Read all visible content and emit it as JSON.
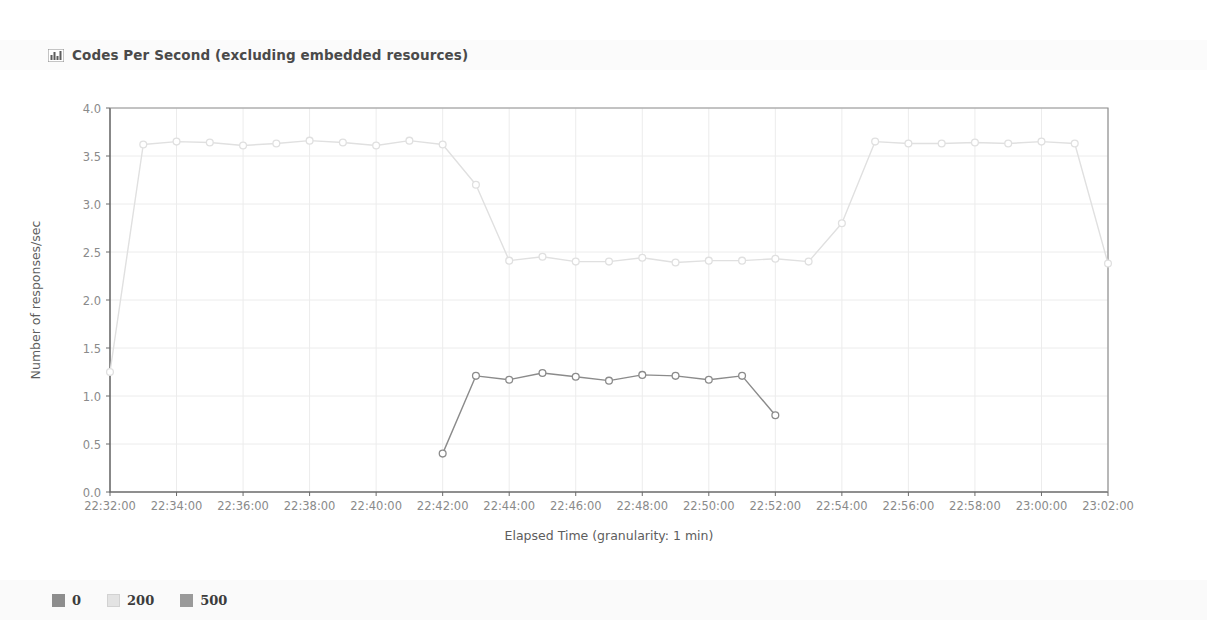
{
  "panel": {
    "icon": "bar-chart-icon",
    "title": "Codes Per Second (excluding embedded resources)"
  },
  "legend": {
    "items": [
      {
        "label": "0",
        "color": "#8d8d8d"
      },
      {
        "label": "200",
        "color": "#e3e3e3"
      },
      {
        "label": "500",
        "color": "#9a9a9a"
      }
    ]
  },
  "chart_data": {
    "type": "line",
    "title": "Codes Per Second (excluding embedded resources)",
    "xlabel": "Elapsed Time (granularity: 1 min)",
    "ylabel": "Number of responses/sec",
    "ylim": [
      0.0,
      4.0
    ],
    "yticks": [
      "0.0",
      "0.5",
      "1.0",
      "1.5",
      "2.0",
      "2.5",
      "3.0",
      "3.5",
      "4.0"
    ],
    "ytick_values": [
      0.0,
      0.5,
      1.0,
      1.5,
      2.0,
      2.5,
      3.0,
      3.5,
      4.0
    ],
    "xticks": [
      "22:32:00",
      "22:34:00",
      "22:36:00",
      "22:38:00",
      "22:40:00",
      "22:42:00",
      "22:44:00",
      "22:46:00",
      "22:48:00",
      "22:50:00",
      "22:52:00",
      "22:54:00",
      "22:56:00",
      "22:58:00",
      "23:00:00",
      "23:02:00"
    ],
    "xtick_minutes": [
      0,
      2,
      4,
      6,
      8,
      10,
      12,
      14,
      16,
      18,
      20,
      22,
      24,
      26,
      28,
      30
    ],
    "xlim_minutes": [
      0,
      30
    ],
    "grid": true,
    "legend_position": "below",
    "markers": "circle",
    "series": [
      {
        "name": "200",
        "color": "#e0e0e0",
        "x_minutes": [
          0,
          1,
          2,
          3,
          4,
          5,
          6,
          7,
          8,
          9,
          10,
          11,
          12,
          13,
          14,
          15,
          16,
          17,
          18,
          19,
          20,
          21,
          22,
          23,
          24,
          25,
          26,
          27,
          28,
          29,
          30
        ],
        "values": [
          1.25,
          3.62,
          3.65,
          3.64,
          3.61,
          3.63,
          3.66,
          3.64,
          3.61,
          3.66,
          3.62,
          3.2,
          2.41,
          2.45,
          2.4,
          2.4,
          2.44,
          2.39,
          2.41,
          2.41,
          2.43,
          2.4,
          2.8,
          3.65,
          3.63,
          3.63,
          3.64,
          3.63,
          3.65,
          3.63,
          2.38
        ]
      },
      {
        "name": "500",
        "color": "#8b8b8b",
        "x_minutes": [
          10,
          11,
          12,
          13,
          14,
          15,
          16,
          17,
          18,
          19,
          20
        ],
        "values": [
          0.4,
          1.21,
          1.17,
          1.24,
          1.2,
          1.16,
          1.22,
          1.21,
          1.17,
          1.21,
          0.8
        ]
      },
      {
        "name": "0",
        "color": "#8d8d8d",
        "x_minutes": [],
        "values": []
      }
    ]
  }
}
